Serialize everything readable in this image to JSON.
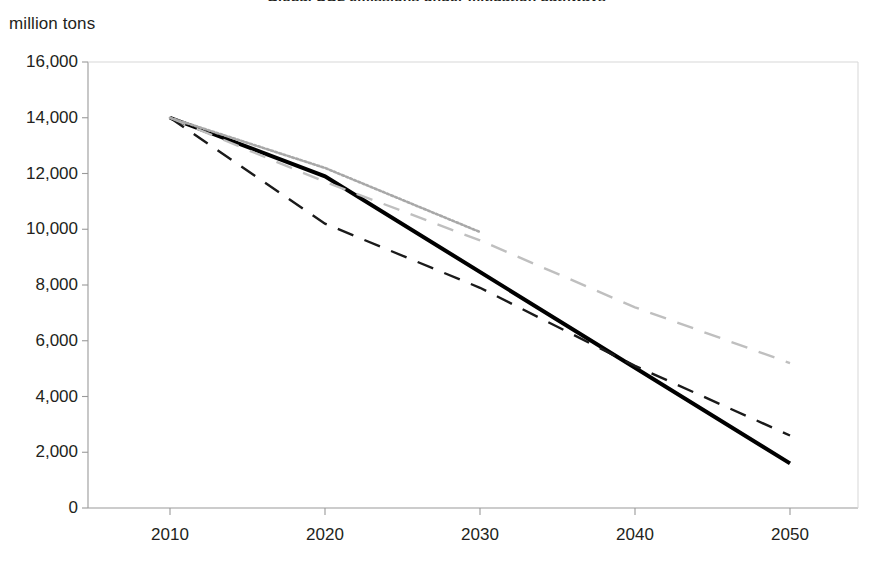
{
  "chart_data": {
    "type": "line",
    "title": "Global CO2 emissions under mitigation pathways",
    "ylabel": "million tons",
    "xlabel": "",
    "x": [
      2010,
      2020,
      2030,
      2040,
      2050
    ],
    "xlim": [
      2010,
      2050
    ],
    "ylim": [
      0,
      16000
    ],
    "ytick_labels": [
      "16,000",
      "14,000",
      "12,000",
      "10,000",
      "8,000",
      "6,000",
      "4,000",
      "2,000",
      "0"
    ],
    "ytick_values": [
      16000,
      14000,
      12000,
      10000,
      8000,
      6000,
      4000,
      2000,
      0
    ],
    "xtick_labels": [
      "2010",
      "2020",
      "2030",
      "2040",
      "2050"
    ],
    "xtick_values": [
      2010,
      2020,
      2030,
      2040,
      2050
    ],
    "grid": false,
    "legend": "none",
    "series": [
      {
        "name": "solid-black-scenario",
        "style": "solid",
        "color": "#000000",
        "width": 4.0,
        "x": [
          2010,
          2020,
          2050
        ],
        "values": [
          14000,
          11900,
          1600
        ]
      },
      {
        "name": "dark-dashed-scenario",
        "style": "dashed",
        "color": "#1a1a1a",
        "width": 2.4,
        "x": [
          2010,
          2020,
          2030,
          2040,
          2050
        ],
        "values": [
          14000,
          10200,
          7900,
          5100,
          2600
        ]
      },
      {
        "name": "light-dashed-scenario",
        "style": "dashed",
        "color": "#bfbfbf",
        "width": 2.4,
        "x": [
          2010,
          2020,
          2030,
          2040,
          2050
        ],
        "values": [
          14000,
          11700,
          9600,
          7200,
          5200
        ]
      },
      {
        "name": "light-dotted-scenario",
        "style": "dotted",
        "color": "#a8a8a8",
        "width": 2.6,
        "x": [
          2010,
          2020,
          2030
        ],
        "values": [
          14000,
          12200,
          9900
        ]
      }
    ],
    "axis_color": "#9a9a9a",
    "frame": {
      "left": 88,
      "right": 858,
      "top": 62,
      "bottom": 508
    },
    "x_origin_px": 170,
    "x_last_px": 790
  }
}
